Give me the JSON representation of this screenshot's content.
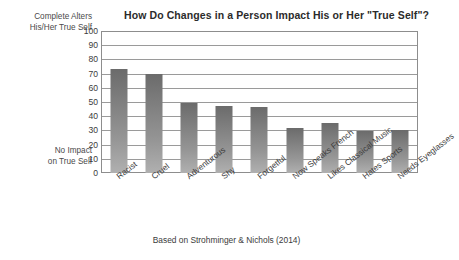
{
  "chart_data": {
    "type": "bar",
    "title": "How Do Changes in a Person Impact His or Her \"True Self\"?",
    "xlabel": "",
    "ylabel": "",
    "ylim": [
      0,
      100
    ],
    "ytick_step": 10,
    "yticks": [
      100,
      90,
      80,
      70,
      60,
      50,
      40,
      30,
      20,
      10,
      0
    ],
    "grid": true,
    "legend": "none",
    "axis_top_note": "Complete Alters His/Her True Self",
    "axis_bottom_note": "No Impact on True Self",
    "categories": [
      "Racist",
      "Cruel",
      "Adventurous",
      "Shy",
      "Forgetful",
      "Now Speaks French",
      "Likes Classical Music",
      "Hates Sports",
      "Needs Eyeglasses"
    ],
    "values": [
      73,
      70,
      49.5,
      47.5,
      46.5,
      31.5,
      35.5,
      29.5,
      30.5
    ],
    "source": "Based on Strohminger & Nichols (2014)",
    "colors": {
      "bar_top": "#6b6b6b",
      "bar_bottom": "#b0b0b0",
      "gridline": "#9a9a9a",
      "frame": "#8d8d8d",
      "text": "#3b3b3b",
      "background": "#ffffff"
    }
  },
  "axis_notes": {
    "top_line1": "Complete Alters",
    "top_line2": "His/Her True Self",
    "bottom_line1": "No Impact",
    "bottom_line2": "on True Self"
  }
}
